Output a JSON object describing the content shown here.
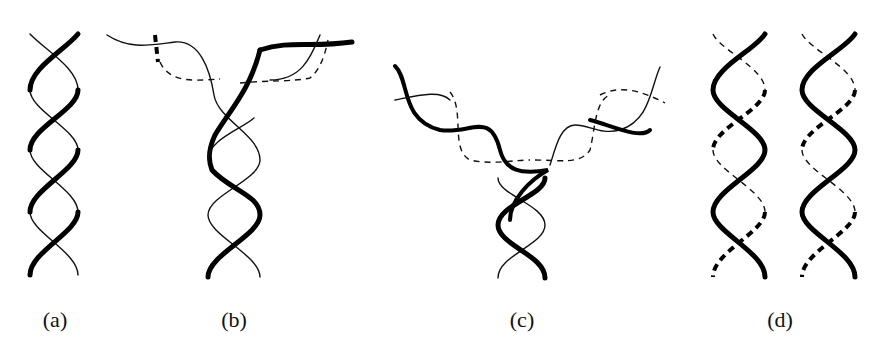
{
  "figure": {
    "panels": [
      {
        "id": "a",
        "label": "(a)",
        "description": "intact double helix"
      },
      {
        "id": "b",
        "label": "(b)",
        "description": "double helix unwinding at one end with new strand synthesis (dashed)"
      },
      {
        "id": "c",
        "label": "(c)",
        "description": "replication fork progressing further down the helix"
      },
      {
        "id": "d",
        "label": "(d)",
        "description": "two daughter double helices, each with one parental and one new strand"
      }
    ],
    "legend": {
      "solid_strand": "parental strand",
      "dashed_strand": "newly synthesized strand"
    },
    "colors": {
      "ink": "#000000",
      "background": "#ffffff"
    }
  }
}
